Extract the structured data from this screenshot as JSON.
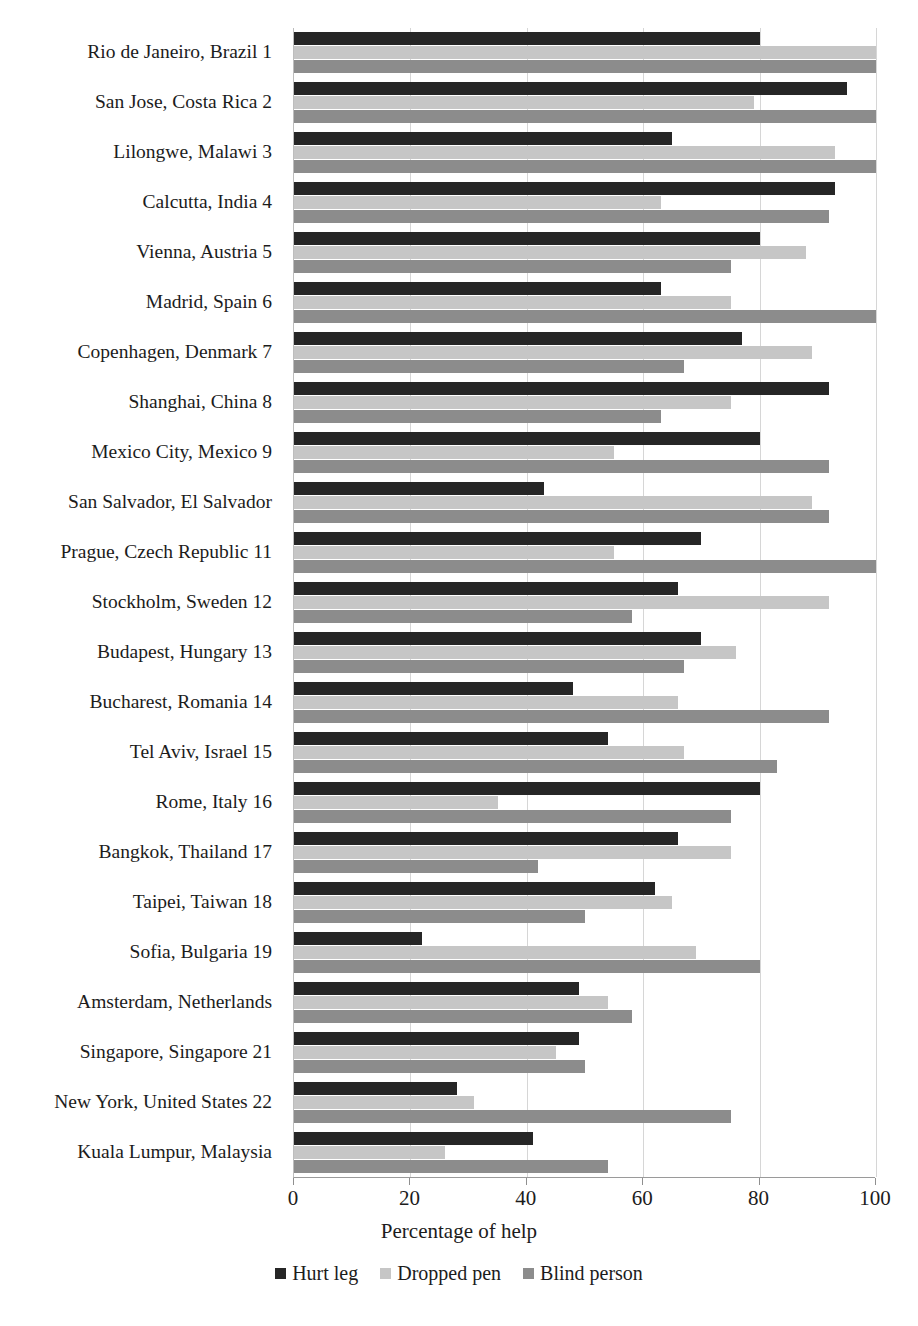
{
  "chart_data": {
    "type": "bar",
    "orientation": "horizontal",
    "title": "",
    "xlabel": "Percentage of help",
    "ylabel": "",
    "xlim": [
      0,
      100
    ],
    "xticks": [
      0,
      20,
      40,
      60,
      80,
      100
    ],
    "xtick_labels": [
      "0",
      "20",
      "40",
      "60",
      "80",
      "100"
    ],
    "grid": "vertical",
    "legend_position": "bottom",
    "categories": [
      "Rio de Janeiro, Brazil 1",
      "San Jose, Costa Rica 2",
      "Lilongwe, Malawi 3",
      "Calcutta, India 4",
      "Vienna, Austria 5",
      "Madrid, Spain 6",
      "Copenhagen, Denmark 7",
      "Shanghai, China 8",
      "Mexico City, Mexico 9",
      "San Salvador, El Salvador",
      "Prague, Czech Republic 11",
      "Stockholm, Sweden 12",
      "Budapest, Hungary 13",
      "Bucharest, Romania 14",
      "Tel Aviv, Israel 15",
      "Rome, Italy 16",
      "Bangkok, Thailand 17",
      "Taipei, Taiwan 18",
      "Sofia, Bulgaria 19",
      "Amsterdam, Netherlands",
      "Singapore, Singapore 21",
      "New York, United States 22",
      "Kuala Lumpur, Malaysia"
    ],
    "series": [
      {
        "name": "Hurt leg",
        "color": "#262626",
        "values": [
          80,
          95,
          65,
          93,
          80,
          63,
          77,
          92,
          80,
          43,
          70,
          66,
          70,
          48,
          54,
          80,
          66,
          62,
          22,
          49,
          49,
          28,
          41
        ]
      },
      {
        "name": "Dropped pen",
        "color": "#c6c6c6",
        "values": [
          100,
          79,
          93,
          63,
          88,
          75,
          89,
          75,
          55,
          89,
          55,
          92,
          76,
          66,
          67,
          35,
          75,
          65,
          69,
          54,
          45,
          31,
          26
        ]
      },
      {
        "name": "Blind person",
        "color": "#8c8c8c",
        "values": [
          100,
          100,
          100,
          92,
          75,
          100,
          67,
          63,
          92,
          92,
          100,
          58,
          67,
          92,
          83,
          75,
          42,
          50,
          80,
          58,
          50,
          75,
          54
        ]
      }
    ]
  }
}
